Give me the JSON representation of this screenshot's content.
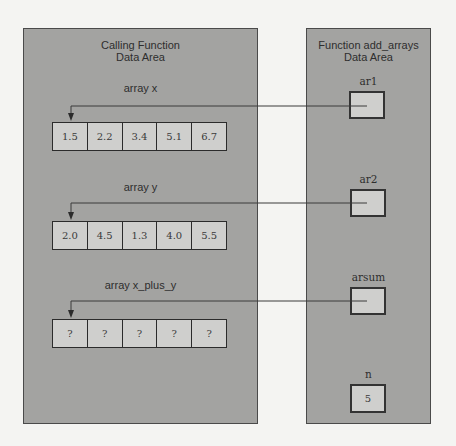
{
  "calling_panel": {
    "title_line1": "Calling Function",
    "title_line2": "Data Area",
    "arrays": [
      {
        "label": "array x",
        "values": [
          "1.5",
          "2.2",
          "3.4",
          "5.1",
          "6.7"
        ]
      },
      {
        "label": "array y",
        "values": [
          "2.0",
          "4.5",
          "1.3",
          "4.0",
          "5.5"
        ]
      },
      {
        "label": "array x_plus_y",
        "values": [
          "?",
          "?",
          "?",
          "?",
          "?"
        ]
      }
    ]
  },
  "function_panel": {
    "title_line1": "Function add_arrays",
    "title_line2": "Data Area",
    "params": [
      {
        "name": "ar1",
        "value": "",
        "points_to": "array x"
      },
      {
        "name": "ar2",
        "value": "",
        "points_to": "array y"
      },
      {
        "name": "arsum",
        "value": "",
        "points_to": "array x_plus_y"
      },
      {
        "name": "n",
        "value": "5"
      }
    ]
  },
  "colors": {
    "page_background": "#f4f4f2",
    "panel_fill": "#a3a3a1",
    "cell_fill": "#cfcfcd",
    "border": "#2b2b2b"
  }
}
